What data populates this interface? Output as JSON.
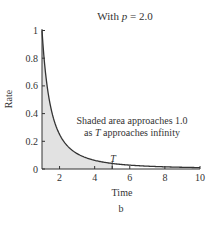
{
  "title_prefix": "With ",
  "title_var": "p",
  "title_suffix": " = 2.0",
  "ylabel": "Rate",
  "xlabel": "Time",
  "panel_label": "b",
  "annotation_line1": "Shaded area approaches 1.0",
  "annotation_line2_pre": "as ",
  "annotation_line2_var": "T",
  "annotation_line2_post": " approaches infinity",
  "T_label": "T",
  "y_ticks": [
    "0",
    "0.2",
    "0.4",
    "0.6",
    "0.8",
    "1"
  ],
  "x_ticks": [
    "2",
    "4",
    "6",
    "8",
    "10"
  ],
  "colors": {
    "curve": "#333333",
    "shade": "#e2e2e2",
    "axis": "#333333"
  },
  "chart_data": {
    "type": "area",
    "title": "With p = 2.0",
    "xlabel": "Time",
    "ylabel": "Rate",
    "function": "rate = 1 / t^2",
    "x": [
      1,
      1.5,
      2,
      2.5,
      3,
      4,
      5,
      6,
      7,
      8,
      9,
      10
    ],
    "y": [
      1.0,
      0.444,
      0.25,
      0.16,
      0.111,
      0.0625,
      0.04,
      0.0278,
      0.0204,
      0.0156,
      0.0123,
      0.01
    ],
    "shaded_region": {
      "from": 1,
      "to": 5,
      "label": "T"
    },
    "annotations": [
      "Shaded area approaches 1.0",
      "as T approaches infinity"
    ],
    "xlim": [
      1,
      10
    ],
    "ylim": [
      0,
      1
    ],
    "x_ticks": [
      2,
      4,
      6,
      8,
      10
    ],
    "y_ticks": [
      0,
      0.2,
      0.4,
      0.6,
      0.8,
      1
    ],
    "grid": false,
    "legend": null
  }
}
